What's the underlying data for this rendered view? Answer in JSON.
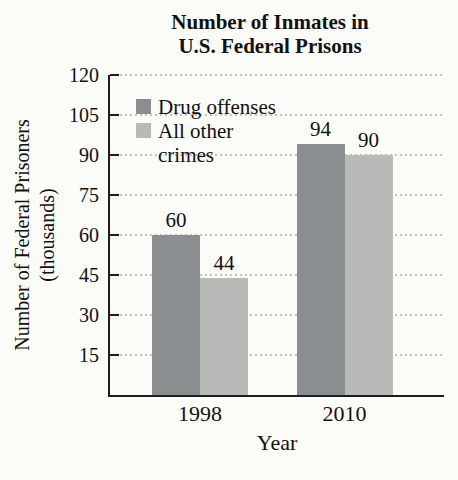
{
  "chart_data": {
    "type": "bar",
    "title": "Number of Inmates in U.S. Federal Prisons",
    "title_line1": "Number of Inmates in",
    "title_line2": "U.S. Federal Prisons",
    "xlabel": "Year",
    "ylabel": "Number of Federal Prisoners (thousands)",
    "ylabel_line1": "Number of Federal Prisoners",
    "ylabel_line2": "(thousands)",
    "categories": [
      "1998",
      "2010"
    ],
    "series": [
      {
        "name": "Drug offenses",
        "values": [
          60,
          94
        ],
        "color": "#8a8e91"
      },
      {
        "name": "All other crimes",
        "values": [
          44,
          90
        ],
        "color": "#b7bab7"
      }
    ],
    "ylim": [
      0,
      120
    ],
    "yticks": [
      15,
      30,
      45,
      60,
      75,
      90,
      105,
      120
    ],
    "grid": "horizontal-dotted",
    "legend_position": "top-left-inside",
    "legend": {
      "items": [
        {
          "label_lines": [
            "Drug offenses"
          ],
          "color": "#8a8e91"
        },
        {
          "label_lines": [
            "All other",
            "crimes"
          ],
          "color": "#b7bab7"
        }
      ]
    }
  },
  "colors": {
    "background": "#fbfbf8",
    "axis": "#1c1c1c",
    "grid": "#c2c2bf",
    "text": "#111111",
    "bar_drug_offenses": "#8a8e91",
    "bar_all_other_crimes": "#b7bab7"
  }
}
